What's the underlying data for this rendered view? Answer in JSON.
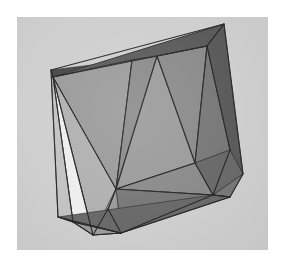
{
  "scene": {
    "title": "3D Polyhedron Mesh Render",
    "object_name": "shaded-triangulated-polyhedron",
    "render_style": "flat-shaded-wireframe",
    "color_mode": "grayscale",
    "canvas": {
      "width": 286,
      "height": 273
    },
    "panel": {
      "name": "render-viewport",
      "x": 17,
      "y": 17,
      "width": 251,
      "height": 233,
      "background_color": "#d3d3d3"
    },
    "page_background_color": "#ffffff",
    "edge_color": "#2a2a2a",
    "edge_width": 1.1,
    "palette": {
      "highlight_white": "#f2f2f2",
      "light_gray": "#c6c6c6",
      "mid_light_gray": "#b4b4b4",
      "mid_gray": "#9e9e9e",
      "mid_dark_gray": "#8d8d8d",
      "dark_gray": "#7a7a7a",
      "darker_gray": "#6c6c6c",
      "darkest_gray": "#5c5c5c",
      "shadow_band": "#4a4a4a"
    }
  },
  "mesh": {
    "vertex_count": 17,
    "face_count": 23,
    "vertices": [
      {
        "id": "v0",
        "name": "top-left-apex",
        "x": 34,
        "y": 53
      },
      {
        "id": "v1",
        "name": "top-left-inner",
        "x": 36,
        "y": 60
      },
      {
        "id": "v2",
        "name": "top-right-apex",
        "x": 207,
        "y": 7
      },
      {
        "id": "v3",
        "name": "top-right-inner",
        "x": 190,
        "y": 29
      },
      {
        "id": "v4",
        "name": "top-ridge-mid-left",
        "x": 115,
        "y": 43
      },
      {
        "id": "v5",
        "name": "top-ridge-mid-right",
        "x": 140,
        "y": 39
      },
      {
        "id": "v6",
        "name": "left-bottom-outer",
        "x": 41,
        "y": 200
      },
      {
        "id": "v7",
        "name": "left-bottom-inner",
        "x": 56,
        "y": 205
      },
      {
        "id": "v8",
        "name": "front-bottom-left",
        "x": 76,
        "y": 218
      },
      {
        "id": "v9",
        "name": "front-bottom-notch",
        "x": 91,
        "y": 192
      },
      {
        "id": "v10",
        "name": "front-bottom-mid",
        "x": 104,
        "y": 216
      },
      {
        "id": "v11",
        "name": "inner-floor-left",
        "x": 99,
        "y": 172
      },
      {
        "id": "v12",
        "name": "inner-floor-right",
        "x": 178,
        "y": 146
      },
      {
        "id": "v13",
        "name": "right-bottom-inner",
        "x": 196,
        "y": 178
      },
      {
        "id": "v14",
        "name": "right-outer-point",
        "x": 226,
        "y": 157
      },
      {
        "id": "v15",
        "name": "right-lower-point",
        "x": 213,
        "y": 180
      },
      {
        "id": "v16",
        "name": "right-mid-edge",
        "x": 213,
        "y": 133
      }
    ],
    "faces": [
      {
        "id": "f00",
        "name": "top-face-band-left",
        "points": "34,53 115,43 140,39 190,29 207,7 36,60",
        "fill": "#4a4a4a"
      },
      {
        "id": "f01",
        "name": "top-face-highlight-strip",
        "points": "36,60 207,7 190,29",
        "fill": "#5c5c5c"
      },
      {
        "id": "f02",
        "name": "back-wall-upper-left",
        "points": "36,60 115,43 99,172",
        "fill": "#9e9e9e"
      },
      {
        "id": "f03",
        "name": "back-wall-left-lower",
        "points": "36,60 99,172 76,218",
        "fill": "#b4b4b4"
      },
      {
        "id": "f04",
        "name": "left-white-triangle",
        "points": "36,60 76,218 56,205",
        "fill": "#f2f2f2"
      },
      {
        "id": "f05",
        "name": "left-side-sliver",
        "points": "34,53 36,60 56,205 41,200",
        "fill": "#c6c6c6"
      },
      {
        "id": "f06",
        "name": "back-wall-center-left",
        "points": "115,43 140,39 99,172",
        "fill": "#8d8d8d"
      },
      {
        "id": "f07",
        "name": "back-wall-center-right",
        "points": "140,39 178,146 99,172",
        "fill": "#9e9e9e"
      },
      {
        "id": "f08",
        "name": "back-wall-right-upper",
        "points": "140,39 190,29 178,146",
        "fill": "#8d8d8d"
      },
      {
        "id": "f09",
        "name": "right-wall-inner",
        "points": "190,29 213,133 178,146",
        "fill": "#7a7a7a"
      },
      {
        "id": "f10",
        "name": "right-wall-outer",
        "points": "190,29 207,7 226,157 213,133",
        "fill": "#5c5c5c"
      },
      {
        "id": "f11",
        "name": "right-wall-lower",
        "points": "213,133 226,157 196,178 178,146",
        "fill": "#6c6c6c"
      },
      {
        "id": "f12",
        "name": "right-corner-facet",
        "points": "226,157 213,180 196,178",
        "fill": "#7a7a7a"
      },
      {
        "id": "f13",
        "name": "floor-strip-upper",
        "points": "99,172 178,146 196,178",
        "fill": "#8d8d8d"
      },
      {
        "id": "f14",
        "name": "floor-strip-mid",
        "points": "99,172 196,178 104,216",
        "fill": "#7a7a7a"
      },
      {
        "id": "f15",
        "name": "floor-strip-lower",
        "points": "104,216 196,178 213,180",
        "fill": "#6c6c6c"
      },
      {
        "id": "f16",
        "name": "front-bevel-left",
        "points": "99,172 104,216 91,192",
        "fill": "#9e9e9e"
      },
      {
        "id": "f17",
        "name": "front-bevel-notch",
        "points": "76,218 99,172 91,192",
        "fill": "#b4b4b4"
      },
      {
        "id": "f18",
        "name": "front-bottom-facet",
        "points": "76,218 91,192 104,216",
        "fill": "#8d8d8d"
      },
      {
        "id": "f19",
        "name": "bottom-lip-left",
        "points": "56,205 76,218 104,216",
        "fill": "#9e9e9e"
      },
      {
        "id": "f20",
        "name": "bottom-lip-sliver",
        "points": "41,200 56,205 104,216",
        "fill": "#b4b4b4"
      },
      {
        "id": "f21",
        "name": "bottom-edge-shadow",
        "points": "41,200 104,216 213,180 196,178",
        "fill": "#6c6c6c"
      },
      {
        "id": "f22",
        "name": "right-tip-facet",
        "points": "196,178 213,180 213,180",
        "fill": "#7a7a7a"
      }
    ],
    "edges": [
      {
        "id": "e00",
        "name": "top-ridge-outer",
        "x1": 34,
        "y1": 53,
        "x2": 207,
        "y2": 7
      },
      {
        "id": "e01",
        "name": "top-ridge-inner",
        "x1": 36,
        "y1": 60,
        "x2": 190,
        "y2": 29
      },
      {
        "id": "e02",
        "name": "top-left-cap",
        "x1": 34,
        "y1": 53,
        "x2": 36,
        "y2": 60
      },
      {
        "id": "e03",
        "name": "top-right-cap",
        "x1": 207,
        "y1": 7,
        "x2": 190,
        "y2": 29
      },
      {
        "id": "e04",
        "name": "rib-mid-left",
        "x1": 115,
        "y1": 43,
        "x2": 99,
        "y2": 172
      },
      {
        "id": "e05",
        "name": "rib-mid-right",
        "x1": 140,
        "y1": 39,
        "x2": 99,
        "y2": 172
      },
      {
        "id": "e06",
        "name": "rib-right",
        "x1": 140,
        "y1": 39,
        "x2": 178,
        "y2": 146
      },
      {
        "id": "e07",
        "name": "rib-right-inner",
        "x1": 190,
        "y1": 29,
        "x2": 178,
        "y2": 146
      },
      {
        "id": "e08",
        "name": "right-wall-crease",
        "x1": 190,
        "y1": 29,
        "x2": 213,
        "y2": 133
      },
      {
        "id": "e09",
        "name": "right-wall-outer",
        "x1": 207,
        "y1": 7,
        "x2": 226,
        "y2": 157
      },
      {
        "id": "e10",
        "name": "right-lower-crease",
        "x1": 213,
        "y1": 133,
        "x2": 196,
        "y2": 178
      },
      {
        "id": "e11",
        "name": "right-tip-upper",
        "x1": 226,
        "y1": 157,
        "x2": 213,
        "y2": 180
      },
      {
        "id": "e12",
        "name": "right-tip-lower",
        "x1": 213,
        "y1": 180,
        "x2": 196,
        "y2": 178
      },
      {
        "id": "e13",
        "name": "left-vertical-outer",
        "x1": 34,
        "y1": 53,
        "x2": 41,
        "y2": 200
      },
      {
        "id": "e14",
        "name": "left-vertical-inner",
        "x1": 36,
        "y1": 60,
        "x2": 56,
        "y2": 205
      },
      {
        "id": "e15",
        "name": "left-diagonal-white",
        "x1": 36,
        "y1": 60,
        "x2": 76,
        "y2": 218
      },
      {
        "id": "e16",
        "name": "back-wall-left-rib",
        "x1": 36,
        "y1": 60,
        "x2": 99,
        "y2": 172
      },
      {
        "id": "e17",
        "name": "floor-edge-upper",
        "x1": 99,
        "y1": 172,
        "x2": 178,
        "y2": 146
      },
      {
        "id": "e18",
        "name": "floor-edge-right",
        "x1": 178,
        "y1": 146,
        "x2": 196,
        "y2": 178
      },
      {
        "id": "e19",
        "name": "floor-fan-a",
        "x1": 99,
        "y1": 172,
        "x2": 196,
        "y2": 178
      },
      {
        "id": "e20",
        "name": "floor-fan-b",
        "x1": 104,
        "y1": 216,
        "x2": 196,
        "y2": 178
      },
      {
        "id": "e21",
        "name": "bottom-edge-front",
        "x1": 41,
        "y1": 200,
        "x2": 104,
        "y2": 216
      },
      {
        "id": "e22",
        "name": "bottom-edge-long",
        "x1": 104,
        "y1": 216,
        "x2": 213,
        "y2": 180
      },
      {
        "id": "e23",
        "name": "bottom-lip-inner",
        "x1": 56,
        "y1": 205,
        "x2": 104,
        "y2": 216
      },
      {
        "id": "e24",
        "name": "bottom-cap-left",
        "x1": 41,
        "y1": 200,
        "x2": 56,
        "y2": 205
      },
      {
        "id": "e25",
        "name": "front-notch-a",
        "x1": 76,
        "y1": 218,
        "x2": 91,
        "y2": 192
      },
      {
        "id": "e26",
        "name": "front-notch-b",
        "x1": 91,
        "y1": 192,
        "x2": 99,
        "y2": 172
      },
      {
        "id": "e27",
        "name": "front-notch-c",
        "x1": 91,
        "y1": 192,
        "x2": 104,
        "y2": 216
      },
      {
        "id": "e28",
        "name": "front-bottom-left-cap",
        "x1": 56,
        "y1": 205,
        "x2": 76,
        "y2": 218
      },
      {
        "id": "e29",
        "name": "front-bottom-mid-cap",
        "x1": 76,
        "y1": 218,
        "x2": 104,
        "y2": 216
      },
      {
        "id": "e30",
        "name": "top-ridge-sub",
        "x1": 36,
        "y1": 60,
        "x2": 115,
        "y2": 43
      },
      {
        "id": "e31",
        "name": "top-ridge-sub-2",
        "x1": 115,
        "y1": 43,
        "x2": 140,
        "y2": 39
      },
      {
        "id": "e32",
        "name": "top-ridge-sub-3",
        "x1": 140,
        "y1": 39,
        "x2": 190,
        "y2": 29
      }
    ]
  }
}
